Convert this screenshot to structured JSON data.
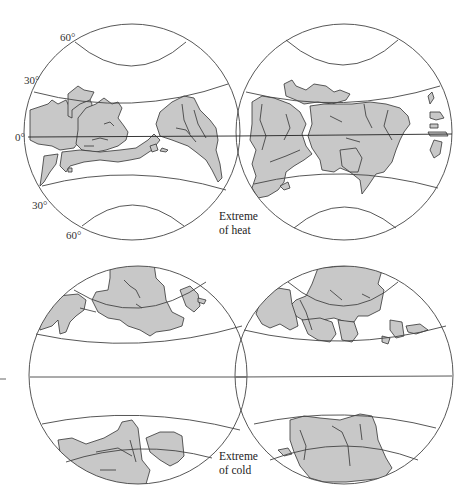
{
  "figure": {
    "panels": [
      {
        "id": "heat",
        "caption_line1": "Extreme",
        "caption_line2": "of heat",
        "latitude_labels": {
          "north_60": "60°",
          "north_30": "30°",
          "equator": "0°",
          "south_30": "30°",
          "south_60": "60°"
        },
        "globes": [
          "west-hemisphere",
          "east-hemisphere"
        ]
      },
      {
        "id": "cold",
        "caption_line1": "Extreme",
        "caption_line2": "of cold",
        "globes": [
          "west-hemisphere",
          "east-hemisphere"
        ]
      }
    ],
    "colors": {
      "land": "#c8c8c8",
      "outline": "#333333",
      "ocean": "#ffffff"
    }
  }
}
